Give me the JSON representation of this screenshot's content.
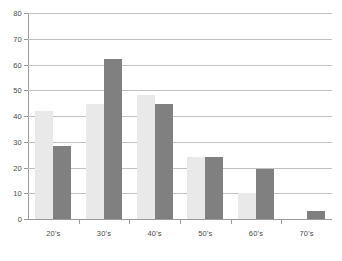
{
  "chart_data": {
    "type": "bar",
    "title": "",
    "subtitle": "",
    "xlabel": "",
    "ylabel": "",
    "categories": [
      "20's",
      "30's",
      "40's",
      "50's",
      "60's",
      "70's"
    ],
    "series": [
      {
        "name": "light",
        "color": "#e9e9e9",
        "values": [
          42,
          44.5,
          48,
          24,
          10,
          0
        ]
      },
      {
        "name": "dark",
        "color": "#808080",
        "values": [
          28.5,
          62,
          44.5,
          24,
          19.5,
          3
        ]
      }
    ],
    "ylim": [
      0,
      80
    ],
    "ytick_step": 10,
    "ytick_labels": [
      "0",
      "10",
      "20",
      "30",
      "40",
      "50",
      "60",
      "70",
      "80"
    ],
    "grid": true,
    "grid_axis": "y",
    "legend": "none",
    "annotations": []
  },
  "style": {
    "background": "#ffffff",
    "grid_color": "#c0c0c0",
    "axis_color": "#9a9a9a",
    "text_color": "#4a4a4a"
  }
}
